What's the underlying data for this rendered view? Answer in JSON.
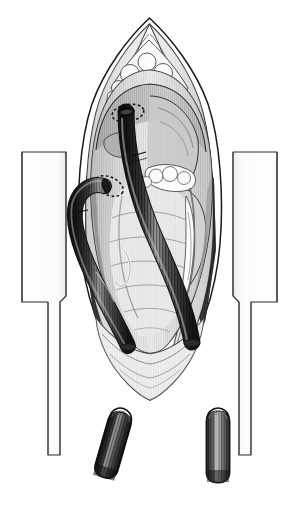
{
  "figure": {
    "title": "Median sternotomy with bicaval cannulation for cardiopulmonary bypass",
    "style": "grayscale pen-and-ink medical illustration",
    "background_color": "#ffffff",
    "canvas": {
      "width": 299,
      "height": 508
    }
  },
  "palette": {
    "background": "#ffffff",
    "outline": "#1a1a1a",
    "retractor_fill": "#ffffff",
    "retractor_stroke": "#2b2b2b",
    "pericardium_light": "#efefef",
    "pericardium_mid": "#d8d8d8",
    "pericardium_shadow": "#9a9a9a",
    "cavity_shadow": "#3a3a3a",
    "heart_light": "#e6e6e6",
    "heart_mid": "#bdbdbd",
    "heart_dark": "#8c8c8c",
    "fat_fill": "#fbfbfb",
    "fat_stroke": "#4a4a4a",
    "cannula_dark": "#2a2a2a",
    "cannula_mid": "#5e5e5e",
    "cannula_highlight": "#b9b9b9",
    "suture_dash": "#111111",
    "vessel_stroke": "#5a5a5a"
  },
  "elements": {
    "retractor_left": {
      "name": "Sternal retractor blade (left)",
      "label": ""
    },
    "retractor_right": {
      "name": "Sternal retractor blade (right)",
      "label": ""
    },
    "pericardial_flap_left": {
      "name": "Reflected pericardial edge (left)",
      "label": ""
    },
    "pericardial_flap_right": {
      "name": "Reflected pericardial edge (right)",
      "label": ""
    },
    "thymic_fat": {
      "name": "Thymic / mediastinal fat pad",
      "label": ""
    },
    "heart": {
      "name": "Exposed heart and great vessels",
      "label": ""
    },
    "epicardial_fat": {
      "name": "Epicardial fat lobules",
      "label": ""
    },
    "cannula_superior": {
      "name": "Superior vena cava cannula",
      "label": ""
    },
    "cannula_inferior": {
      "name": "Inferior vena cava cannula",
      "label": ""
    },
    "pursestring_superior": {
      "name": "Purse-string suture (superior)",
      "label": ""
    },
    "pursestring_inferior": {
      "name": "Purse-string suture (inferior)",
      "label": ""
    },
    "tube_segment_left": {
      "name": "Detached bypass tubing segment (left, tilted)",
      "label": ""
    },
    "tube_segment_right": {
      "name": "Detached bypass tubing segment (right, vertical)",
      "label": ""
    }
  },
  "annotations": {
    "text_labels": [],
    "leader_lines": [],
    "callout_count": 0
  }
}
